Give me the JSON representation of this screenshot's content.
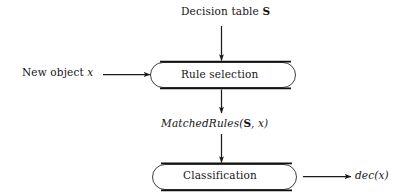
{
  "diagram": {
    "background_color": "#ffffff",
    "stroke_color": "#1a1a1a",
    "nodes": [
      {
        "id": "rule-selection",
        "label": "Rule selection",
        "shape": "stadium"
      },
      {
        "id": "classification",
        "label": "Classification",
        "shape": "stadium"
      }
    ],
    "labels": {
      "decision_table": "Decision table ᴺ",
      "decision_table_text": "Decision table",
      "decision_table_symbol": "S",
      "new_object_text": "New object",
      "new_object_var": "x",
      "matched_rules_fn": "MatchedRules",
      "matched_rules_open": "(",
      "matched_rules_symbol": "S",
      "matched_rules_sep": ", ",
      "matched_rules_var": "x",
      "matched_rules_close": ")",
      "dec_fn": "dec",
      "dec_open": "(",
      "dec_var": "x",
      "dec_close": ")"
    },
    "edges": [
      {
        "id": "edge-table-to-rule",
        "from": "decision-table-label",
        "to": "rule-selection",
        "direction": "down"
      },
      {
        "id": "edge-object-to-rule",
        "from": "new-object-label",
        "to": "rule-selection",
        "direction": "right"
      },
      {
        "id": "edge-rule-to-matched",
        "from": "rule-selection",
        "to": "matched-rules",
        "direction": "down"
      },
      {
        "id": "edge-matched-to-classify",
        "from": "matched-rules",
        "to": "classification",
        "direction": "down"
      },
      {
        "id": "edge-classify-to-dec",
        "from": "classification",
        "to": "dec-label",
        "direction": "right"
      }
    ]
  }
}
